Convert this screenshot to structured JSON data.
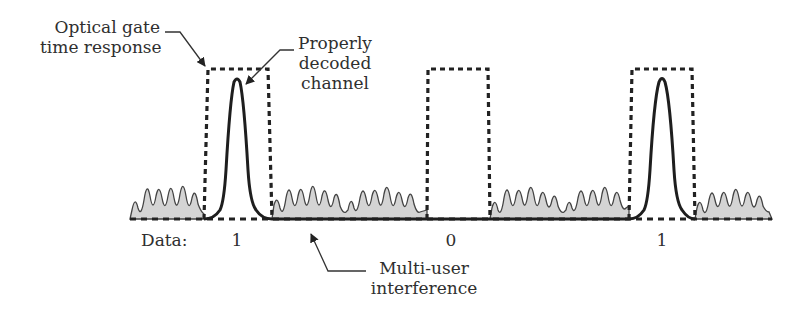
{
  "annotations": {
    "optical_gate": [
      "Optical gate",
      "time response"
    ],
    "properly_decoded": [
      "Properly",
      "decoded",
      "channel"
    ],
    "mui": [
      "Multi-user",
      "interference"
    ]
  },
  "data_row": {
    "label": "Data:",
    "bits": [
      "1",
      "0",
      "1"
    ]
  },
  "colors": {
    "stroke": "#222222",
    "mui_fill": "#d4d4d4",
    "mui_stroke": "#444444"
  },
  "diagram": {
    "baseline_y": 219,
    "gates": [
      {
        "bit": "1",
        "x0": 205,
        "x1": 270,
        "top": 69,
        "pulse_center": 237,
        "pulse_top": 78
      },
      {
        "bit": "0",
        "x0": 427,
        "x1": 488,
        "top": 69
      },
      {
        "bit": "1",
        "x0": 629,
        "x1": 693,
        "top": 69,
        "pulse_center": 662,
        "pulse_top": 77
      }
    ],
    "mui_segments": [
      [
        130,
        204
      ],
      [
        272,
        427
      ],
      [
        490,
        629
      ],
      [
        695,
        772
      ]
    ]
  }
}
